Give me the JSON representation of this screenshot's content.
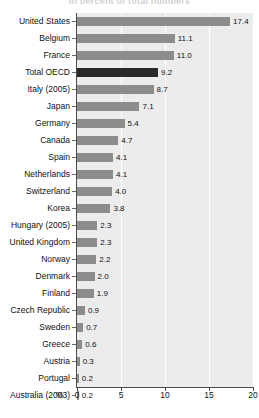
{
  "chart_data": {
    "type": "bar",
    "orientation": "horizontal",
    "title": "In percent of total numbers",
    "xlabel": "%",
    "ylabel": "",
    "xlim": [
      0,
      20
    ],
    "xticks": [
      "0",
      "5",
      "10",
      "15",
      "20"
    ],
    "grid": "vertical-white",
    "legend": "none",
    "unit": "%",
    "highlight_color": "#2a2a2a",
    "bar_color": "#8c8c8c",
    "plot_background": "#ececed",
    "categories": [
      "United States",
      "Belgium",
      "France",
      "Total OECD",
      "Italy (2005)",
      "Japan",
      "Germany",
      "Canada",
      "Spain",
      "Netherlands",
      "Switzerland",
      "Korea",
      "Hungary (2005)",
      "United Kingdom",
      "Norway",
      "Denmark",
      "Finland",
      "Czech Republic",
      "Sweden",
      "Greece",
      "Austria",
      "Portugal",
      "Australia (2003)"
    ],
    "values": [
      17.4,
      11.1,
      11.0,
      9.2,
      8.7,
      7.1,
      5.4,
      4.7,
      4.1,
      4.1,
      4.0,
      3.8,
      2.3,
      2.3,
      2.2,
      2.0,
      1.9,
      0.9,
      0.7,
      0.6,
      0.3,
      0.2,
      0.2
    ],
    "value_labels": [
      "17.4",
      "11.1",
      "11.0",
      "9.2",
      "8.7",
      "7.1",
      "5.4",
      "4.7",
      "4.1",
      "4.1",
      "4.0",
      "3.8",
      "2.3",
      "2.3",
      "2.2",
      "2.0",
      "1.9",
      "0.9",
      "0.7",
      "0.6",
      "0.3",
      "0.2",
      "0.2"
    ],
    "highlighted": [
      "Total OECD"
    ]
  }
}
